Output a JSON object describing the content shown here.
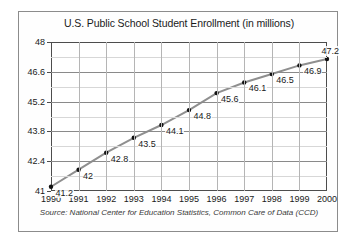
{
  "figure": {
    "title": "U.S. Public School Student Enrollment (in millions)",
    "source": "Source: National Center for Education Statistics, Common Care of Data (CCD)"
  },
  "chart_data": {
    "type": "line",
    "title": "U.S. Public School Student Enrollment (in millions)",
    "xlabel": "",
    "ylabel": "",
    "categories": [
      "1990",
      "1991",
      "1992",
      "1993",
      "1994",
      "1995",
      "1996",
      "1997",
      "1998",
      "1999",
      "2000"
    ],
    "values": [
      41.2,
      42,
      42.8,
      43.5,
      44.1,
      44.8,
      45.6,
      46.1,
      46.5,
      46.9,
      47.2
    ],
    "point_labels": [
      "41.2",
      "42",
      "42.8",
      "43.5",
      "44.1",
      "44.8",
      "45.6",
      "46.1",
      "46.5",
      "46.9",
      "47.2"
    ],
    "ylim": [
      41,
      48
    ],
    "ytick_labels": [
      "48",
      "46.6",
      "45.2",
      "43.8",
      "42.4",
      "41"
    ],
    "ytick_values": [
      48,
      46.6,
      45.2,
      43.8,
      42.4,
      41
    ],
    "minor_ytick_values": [
      47.3,
      45.9,
      44.5,
      43.1,
      41.7
    ],
    "grid": true,
    "legend": "none",
    "line_color": "#8f8f8f",
    "marker_color": "#111111",
    "series_name": "Enrollment"
  }
}
